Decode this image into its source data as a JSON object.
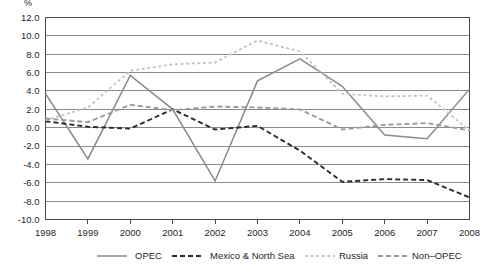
{
  "chart_data": {
    "type": "line",
    "title": "",
    "subtitle": "",
    "unit_label": "%",
    "xlabel": "",
    "ylabel": "",
    "x": [
      1998,
      1999,
      2000,
      2001,
      2002,
      2003,
      2004,
      2005,
      2006,
      2007,
      2008
    ],
    "xtick_labels": [
      "1998",
      "1999",
      "2000",
      "2001",
      "2002",
      "2003",
      "2004",
      "2005",
      "2006",
      "2007",
      "2008"
    ],
    "ytick_labels": [
      "12.0",
      "10.0",
      "8.0",
      "6.0",
      "4.0",
      "2.0",
      "0.0",
      "-2.0",
      "-4.0",
      "-6.0",
      "-8.0",
      "-10.0"
    ],
    "ytick_values": [
      12.0,
      10.0,
      8.0,
      6.0,
      4.0,
      2.0,
      0.0,
      -2.0,
      -4.0,
      -6.0,
      -8.0,
      -10.0
    ],
    "ylim": [
      -10.0,
      12.0
    ],
    "xlim": [
      1998,
      2008
    ],
    "grid": true,
    "legend_position": "bottom",
    "series": [
      {
        "name": "OPEC",
        "style": "solid",
        "color": "#8a8a8a",
        "values": [
          3.7,
          -3.4,
          5.7,
          2.0,
          -5.8,
          5.1,
          7.5,
          4.5,
          -0.8,
          -1.2,
          4.2
        ]
      },
      {
        "name": "Mexico & North Sea",
        "style": "dashed",
        "color": "#2b2b2b",
        "values": [
          0.7,
          0.1,
          -0.1,
          2.0,
          -0.2,
          0.2,
          -2.5,
          -5.9,
          -5.6,
          -5.7,
          -7.6
        ]
      },
      {
        "name": "Russia",
        "style": "dotted",
        "color": "#c4c4c4",
        "values": [
          0.8,
          2.2,
          6.2,
          6.9,
          7.1,
          9.5,
          8.3,
          3.7,
          3.4,
          3.5,
          -0.3
        ]
      },
      {
        "name": "Non-OPEC",
        "style": "dashed",
        "color": "#9b9b9b",
        "values": [
          1.0,
          0.6,
          2.5,
          1.9,
          2.3,
          2.2,
          2.0,
          -0.2,
          0.3,
          0.5,
          -0.3
        ]
      }
    ]
  },
  "legend": {
    "items": [
      {
        "label": "OPEC"
      },
      {
        "label": "Mexico & North Sea"
      },
      {
        "label": "Russia"
      },
      {
        "label": "Non–OPEC"
      }
    ]
  },
  "colors": {
    "opec": "#8a8a8a",
    "mexico_north_sea": "#2b2b2b",
    "russia": "#c4c4c4",
    "non_opec": "#9b9b9b",
    "grid": "#6f6f6f",
    "frame": "#4a4a4a",
    "text": "#1f1f1f",
    "background": "#ffffff"
  }
}
